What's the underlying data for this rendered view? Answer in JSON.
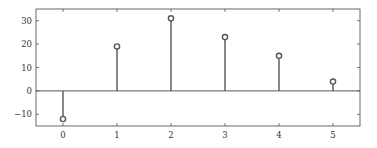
{
  "chart_data": {
    "type": "stem",
    "title": "",
    "xlabel": "",
    "ylabel": "",
    "x": [
      0,
      1,
      2,
      3,
      4,
      5
    ],
    "values": [
      -12,
      19,
      31,
      23,
      15,
      4
    ],
    "xlim": [
      -0.5,
      5.5
    ],
    "ylim": [
      -15,
      35
    ],
    "xticks": [
      0,
      1,
      2,
      3,
      4,
      5
    ],
    "xtick_labels": [
      "0",
      "1",
      "2",
      "3",
      "4",
      "5"
    ],
    "yticks": [
      30,
      20,
      10,
      0,
      -10
    ],
    "ytick_labels": [
      "30",
      "20",
      "10",
      "0",
      "−10"
    ],
    "baseline": 0,
    "marker": "open-circle",
    "grid": false,
    "legend": null
  },
  "style": {
    "line_color": "#555555",
    "frame_color": "#444444",
    "background": "#ffffff"
  }
}
